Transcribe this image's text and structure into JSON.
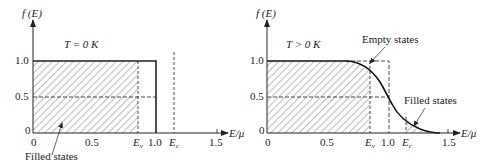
{
  "left_panel": {
    "y_axis_label": "f (E)",
    "x_axis_label": "E/μ",
    "condition": "T = 0 K",
    "y_ticks": [
      "1.0",
      "0.5",
      "0"
    ],
    "x_ticks": [
      "0",
      "0.5",
      "1.0",
      "1.5"
    ],
    "ev_label": "E",
    "ev_sub": "v",
    "ec_label": "E",
    "ec_sub": "c",
    "annotation": "Filled states"
  },
  "right_panel": {
    "y_axis_label": "f (E)",
    "x_axis_label": "E/μ",
    "condition": "T > 0 K",
    "y_ticks": [
      "1.0",
      "0.5",
      "0"
    ],
    "x_ticks": [
      "0",
      "0.5",
      "1.0",
      "1.5"
    ],
    "ev_label": "E",
    "ev_sub": "v",
    "ec_label": "E",
    "ec_sub": "c",
    "annotation_empty": "Empty states",
    "annotation_filled": "Filled states"
  }
}
